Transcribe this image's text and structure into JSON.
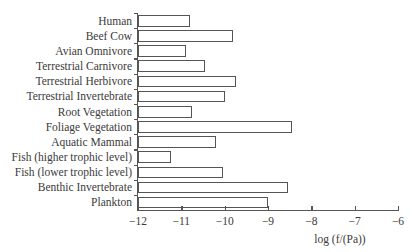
{
  "chart_data": {
    "type": "bar",
    "orientation": "horizontal",
    "title": "",
    "xlabel": "log (f/(Pa))",
    "ylabel": "",
    "xlim": [
      -12,
      -6
    ],
    "xticks": [
      -12,
      -11,
      -10,
      -9,
      -8,
      -7,
      -6
    ],
    "xtick_labels": [
      "−12",
      "−11",
      "−10",
      "−9",
      "−8",
      "−7",
      "−6"
    ],
    "grid": false,
    "legend": null,
    "categories": [
      "Human",
      "Beef Cow",
      "Avian Omnivore",
      "Terrestrial Carnivore",
      "Terrestrial Herbivore",
      "Terrestrial Invertebrate",
      "Root Vegetation",
      "Foliage Vegetation",
      "Aquatic Mammal",
      "Fish (higher trophic level)",
      "Fish (lower trophic level)",
      "Benthic Invertebrate",
      "Plankton"
    ],
    "values": [
      -10.8,
      -9.8,
      -10.9,
      -10.45,
      -9.75,
      -10.0,
      -10.75,
      -8.45,
      -10.2,
      -11.25,
      -10.05,
      -8.55,
      -9.0
    ],
    "bar_base": -12
  },
  "colors": {
    "bar_fill": "#ffffff",
    "bar_stroke": "#555555",
    "axis": "#555555",
    "text": "#3a3a3a"
  }
}
